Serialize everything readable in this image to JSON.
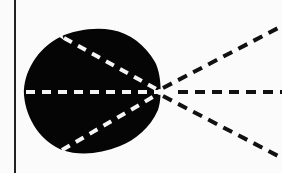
{
  "diagram": {
    "type": "geometric-figure",
    "colors": {
      "background": "#fbfbfb",
      "shape_fill": "#050505",
      "dash_inside": "#f5f5f5",
      "dash_outside": "#111111",
      "border_line": "#222222"
    },
    "border_line": {
      "x": 15,
      "y1": 0,
      "y2": 173
    },
    "vertex": {
      "x": 160,
      "y": 92
    },
    "rays": [
      {
        "name": "upper-ray",
        "from": [
          62,
          37
        ],
        "to": [
          282,
          26
        ]
      },
      {
        "name": "middle-ray",
        "from": [
          25,
          92
        ],
        "to": [
          282,
          92
        ]
      },
      {
        "name": "lower-ray",
        "from": [
          62,
          150
        ],
        "to": [
          282,
          158
        ]
      }
    ],
    "text": []
  }
}
